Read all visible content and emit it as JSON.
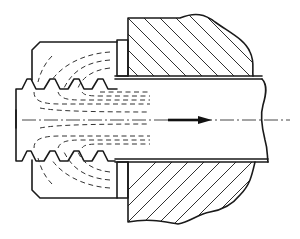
{
  "diagram": {
    "type": "technical-cross-section",
    "components": [
      {
        "id": "nut",
        "label": "Threaded nut (left)"
      },
      {
        "id": "washer",
        "label": "Collar / washer"
      },
      {
        "id": "wall",
        "label": "Hatched wall section"
      },
      {
        "id": "pipe",
        "label": "Pipe / shaft"
      },
      {
        "id": "threads",
        "label": "Thread profile"
      },
      {
        "id": "flow-lines",
        "label": "Dashed force-flow lines"
      },
      {
        "id": "centerline",
        "label": "Center axis (dash-dot)"
      },
      {
        "id": "arrow",
        "label": "Direction arrow (pointing right)"
      }
    ],
    "colors": {
      "line": "#1a1a1a",
      "background": "#ffffff"
    }
  }
}
